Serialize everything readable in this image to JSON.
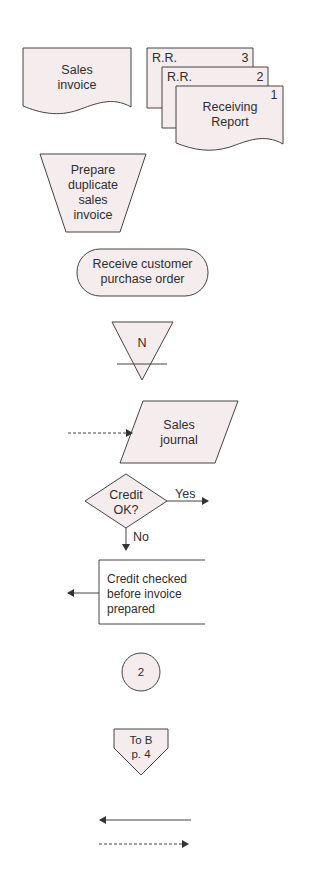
{
  "colors": {
    "fill": "#f5ecee",
    "stroke": "#444444",
    "text": "#2e2e2e",
    "background": "#ffffff"
  },
  "symbols": {
    "sales_invoice": {
      "type": "document",
      "line1": "Sales",
      "line2": "invoice"
    },
    "receiving_reports": {
      "type": "multiple-documents",
      "copy3": {
        "label": "R.R.",
        "number": "3"
      },
      "copy2": {
        "label": "R.R.",
        "number": "2"
      },
      "copy1": {
        "number": "1",
        "line1": "Receiving",
        "line2": "Report"
      }
    },
    "manual_operation": {
      "type": "manual-operation",
      "line1": "Prepare",
      "line2": "duplicate",
      "line3": "sales",
      "line4": "invoice"
    },
    "terminal": {
      "type": "terminal",
      "line1": "Receive customer",
      "line2": "purchase order"
    },
    "offline_storage": {
      "type": "file",
      "label": "N"
    },
    "journal": {
      "type": "input-output",
      "line1": "Sales",
      "line2": "journal"
    },
    "decision": {
      "type": "decision",
      "line1": "Credit",
      "line2": "OK?",
      "yes": "Yes",
      "no": "No"
    },
    "annotation": {
      "type": "annotation",
      "line1": "Credit checked",
      "line2": "before invoice",
      "line3": "prepared"
    },
    "on_page_connector": {
      "type": "on-page-connector",
      "label": "2"
    },
    "off_page_connector": {
      "type": "off-page-connector",
      "line1": "To B",
      "line2": "p. 4"
    },
    "document_flow": {
      "type": "solid-arrow-left"
    },
    "information_flow": {
      "type": "dashed-arrow-right"
    }
  }
}
